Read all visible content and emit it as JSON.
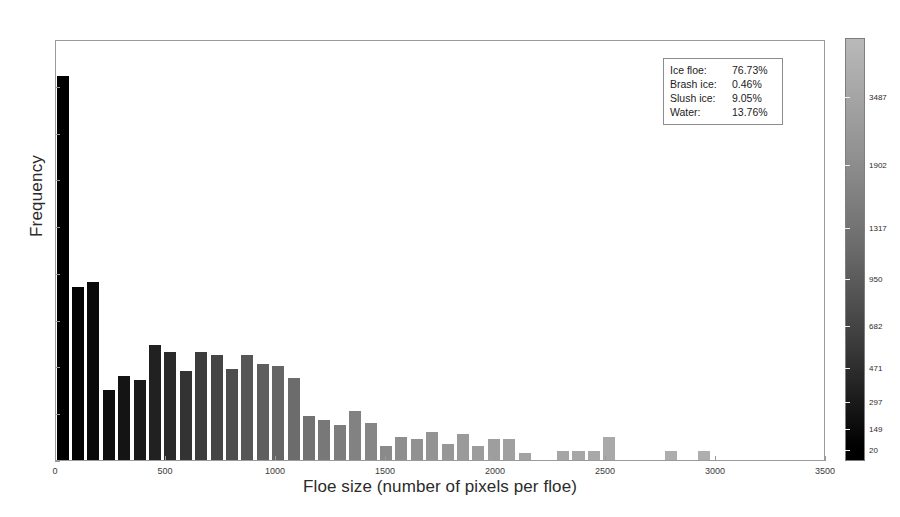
{
  "chart_data": {
    "type": "bar",
    "title": "",
    "subtitle": "",
    "xlabel": "Floe size (number of pixels per floe)",
    "ylabel": "Frequency",
    "xlim": [
      0,
      3500
    ],
    "ylim": [
      0,
      90
    ],
    "grid": false,
    "bar_width": 65,
    "x_ticks": [
      0,
      500,
      1000,
      1500,
      2000,
      2500,
      3000,
      3500
    ],
    "x_tick_labels": [
      "0",
      "500",
      "1000",
      "1500",
      "2000",
      "2500",
      "3000",
      "3500"
    ],
    "y_ticks": [
      0,
      10,
      20,
      30,
      40,
      50,
      60,
      70,
      80,
      90
    ],
    "y_tick_labels": [
      "0",
      "10",
      "20",
      "30",
      "40",
      "50",
      "60",
      "70",
      "80",
      "90"
    ],
    "x": [
      35,
      105,
      175,
      245,
      315,
      385,
      455,
      525,
      595,
      665,
      735,
      805,
      875,
      945,
      1015,
      1085,
      1155,
      1225,
      1295,
      1365,
      1435,
      1505,
      1575,
      1645,
      1715,
      1785,
      1855,
      1925,
      1995,
      2065,
      2135,
      2310,
      2380,
      2450,
      2520,
      2800,
      2950
    ],
    "values": [
      82,
      37,
      38,
      15,
      18,
      17,
      24.5,
      23,
      19,
      23,
      22.5,
      19.5,
      22.5,
      20.5,
      20,
      17.5,
      9.5,
      8.5,
      7.5,
      10.5,
      8,
      3,
      5,
      4.5,
      6,
      3.5,
      5.5,
      3,
      4.5,
      4.5,
      1.5,
      2,
      2,
      2,
      5,
      2,
      2
    ],
    "bar_colors": [
      "#000000",
      "#040404",
      "#090909",
      "#0e0e0e",
      "#141414",
      "#1a1a1a",
      "#212121",
      "#2a2a2a",
      "#333333",
      "#3c3c3c",
      "#454545",
      "#4e4e4e",
      "#565656",
      "#5e5e5e",
      "#656565",
      "#6c6c6c",
      "#727272",
      "#787878",
      "#7d7d7d",
      "#828282",
      "#868686",
      "#8a8a8a",
      "#8e8e8e",
      "#919191",
      "#949494",
      "#979797",
      "#9a9a9a",
      "#9c9c9c",
      "#9e9e9e",
      "#a0a0a0",
      "#a2a2a2",
      "#a6a6a6",
      "#a7a7a7",
      "#a8a8a8",
      "#a9a9a9",
      "#adadad",
      "#aeaeae"
    ],
    "colorbar": {
      "ticks": [
        3487,
        1902,
        1317,
        950,
        682,
        471,
        297,
        149,
        20
      ],
      "tick_labels": [
        "3487",
        "1902",
        "1317",
        "950",
        "682",
        "471",
        "297",
        "149",
        "20"
      ],
      "tick_positions_pct": [
        14,
        30,
        45,
        57,
        68,
        78,
        86,
        92.5,
        97.5
      ],
      "color_top": "#b9b9b9",
      "color_bottom": "#000000"
    },
    "annotation_box": {
      "rows": [
        {
          "name": "Ice floe:",
          "value": "76.73%"
        },
        {
          "name": "Brash ice:",
          "value": "0.46%"
        },
        {
          "name": "Slush ice:",
          "value": "9.05%"
        },
        {
          "name": "Water:",
          "value": "13.76%"
        }
      ]
    }
  }
}
